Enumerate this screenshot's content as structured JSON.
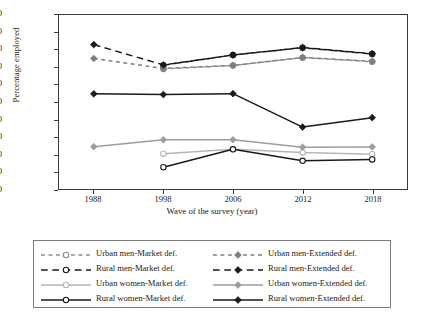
{
  "chart_data": {
    "type": "line",
    "title": "",
    "xlabel": "Wave of the survey (year)",
    "ylabel": "Percentage employed",
    "categories": [
      "1988",
      "1998",
      "2006",
      "2012",
      "2018"
    ],
    "ylim": [
      0,
      100
    ],
    "yticks": [
      0,
      10,
      20,
      30,
      40,
      50,
      60,
      70,
      80,
      90,
      100
    ],
    "grid": false,
    "legend_position": "bottom",
    "series": [
      {
        "name": "Urban men-Market def.",
        "color": "#8a8a8a",
        "marker": "open-circle",
        "dash": "dotted",
        "values": [
          null,
          69.0,
          71.0,
          75.5,
          73.2
        ]
      },
      {
        "name": "Rural men-Market def.",
        "color": "#1a1a1a",
        "marker": "open-circle",
        "dash": "dashed",
        "values": [
          null,
          71.2,
          77.0,
          81.2,
          77.6
        ]
      },
      {
        "name": "Urban women-Market def.",
        "color": "#b5b5b5",
        "marker": "open-circle",
        "dash": "solid",
        "values": [
          null,
          20.3,
          22.8,
          21.0,
          20.0
        ]
      },
      {
        "name": "Rural women-Market def.",
        "color": "#1a1a1a",
        "marker": "open-circle",
        "dash": "solid",
        "values": [
          null,
          12.5,
          22.8,
          16.2,
          17.0
        ]
      },
      {
        "name": "Urban men-Extended def.",
        "color": "#7d7d7d",
        "marker": "filled-diamond",
        "dash": "dotted",
        "values": [
          75.0,
          69.3,
          71.0,
          75.6,
          73.4
        ]
      },
      {
        "name": "Rural men-Extended def.",
        "color": "#1a1a1a",
        "marker": "filled-diamond",
        "dash": "dashed",
        "values": [
          83.0,
          71.3,
          77.0,
          81.3,
          77.8
        ]
      },
      {
        "name": "Urban women-Extended def.",
        "color": "#9d9d9d",
        "marker": "filled-diamond",
        "dash": "solid",
        "values": [
          24.3,
          28.3,
          28.3,
          24.0,
          24.2
        ]
      },
      {
        "name": "Rural women-Extended def.",
        "color": "#1a1a1a",
        "marker": "filled-diamond",
        "dash": "solid",
        "values": [
          54.7,
          54.3,
          54.8,
          35.6,
          41.0
        ]
      }
    ]
  },
  "axis": {
    "ylabel": "Percentage employed",
    "xlabel": "Wave of the survey (year)",
    "yticks": [
      "100",
      "90",
      "80",
      "70",
      "60",
      "50",
      "40",
      "30",
      "20",
      "10",
      "0"
    ],
    "xticks": [
      "1988",
      "1998",
      "2006",
      "2012",
      "2018"
    ]
  },
  "legend": {
    "items": [
      {
        "label": "Urban men-Market def."
      },
      {
        "label": "Urban men-Extended def."
      },
      {
        "label": "Rural men-Market def."
      },
      {
        "label": "Rural men-Extended def."
      },
      {
        "label": "Urban women-Market def."
      },
      {
        "label": "Urban women-Extended def."
      },
      {
        "label": "Rural women-Market def."
      },
      {
        "label": "Rural women-Extended def."
      }
    ]
  }
}
